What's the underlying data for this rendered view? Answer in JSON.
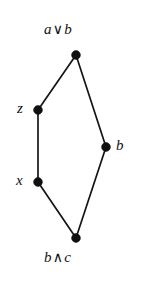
{
  "diagram": {
    "kind": "hasse-diagram",
    "title": "",
    "background_color": "#ffffff",
    "node_color": "#101010",
    "edge_color": "#151515",
    "nodes": [
      {
        "id": "top",
        "label_text": "a",
        "operator": "∨",
        "label_text2": "b",
        "full_label": "a ∨ b",
        "label_position": "above",
        "x": 76,
        "y": 55
      },
      {
        "id": "z",
        "label_text": "z",
        "operator": "",
        "label_text2": "",
        "full_label": "z",
        "label_position": "left",
        "x": 38,
        "y": 110
      },
      {
        "id": "b",
        "label_text": "b",
        "operator": "",
        "label_text2": "",
        "full_label": "b",
        "label_position": "right",
        "x": 106,
        "y": 147
      },
      {
        "id": "x",
        "label_text": "x",
        "operator": "",
        "label_text2": "",
        "full_label": "x",
        "label_position": "left",
        "x": 38,
        "y": 182
      },
      {
        "id": "bottom",
        "label_text": "b",
        "operator": "∧",
        "label_text2": "c",
        "full_label": "b ∧ c",
        "label_position": "below",
        "x": 76,
        "y": 238
      }
    ],
    "edges": [
      {
        "from": "top",
        "to": "z"
      },
      {
        "from": "top",
        "to": "b"
      },
      {
        "from": "z",
        "to": "x"
      },
      {
        "from": "b",
        "to": "bottom"
      },
      {
        "from": "x",
        "to": "bottom"
      }
    ]
  }
}
